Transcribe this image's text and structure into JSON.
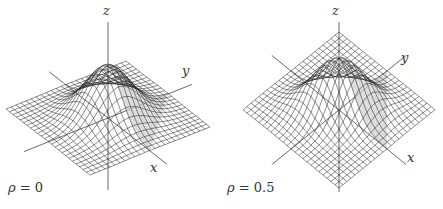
{
  "figure": {
    "panels": [
      {
        "id": "left",
        "rho_symbol": "ρ",
        "rho_eq": "= 0",
        "rho_value": 0,
        "axis_labels": {
          "x": "x",
          "y": "y",
          "z": "z"
        }
      },
      {
        "id": "right",
        "rho_symbol": "ρ",
        "rho_eq": "= 0.5",
        "rho_value": 0.5,
        "axis_labels": {
          "x": "x",
          "y": "y",
          "z": "z"
        }
      }
    ]
  },
  "colors": {
    "mesh": "#2a2a2a",
    "shade": "#cfcfcf",
    "axis": "#444444",
    "background": "#ffffff"
  }
}
